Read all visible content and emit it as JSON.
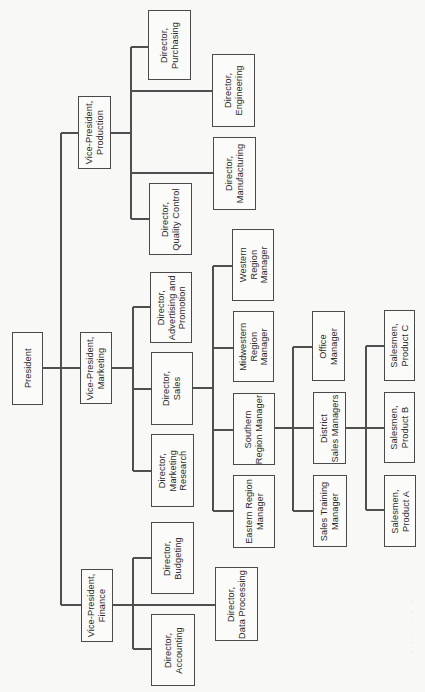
{
  "diagram": {
    "type": "organization-chart",
    "orientation": "rotated-90-ccw",
    "colors": {
      "line": "#4f4f4f",
      "box_border": "#4a4a4a",
      "background": "#f8f8f6",
      "text": "#2b2b2b"
    },
    "nodes": {
      "president": {
        "label": "President",
        "box": [
          12,
          332,
          31,
          73
        ]
      },
      "vp_production": {
        "label": "Vice-President,\nProduction",
        "box": [
          78,
          96,
          33,
          73
        ]
      },
      "vp_marketing": {
        "label": "Vice-President,\nMarketing",
        "box": [
          80,
          332,
          32,
          72
        ]
      },
      "vp_finance": {
        "label": "Vice-President,\nFinance",
        "box": [
          81,
          569,
          32,
          73
        ]
      },
      "dir_purchasing": {
        "label": "Director,\nPurchasing",
        "box": [
          148,
          10,
          43,
          70
        ]
      },
      "dir_engineering": {
        "label": "Director,\nEngineering",
        "box": [
          212,
          54,
          43,
          73
        ]
      },
      "dir_manufacturing": {
        "label": "Director,\nManufacturing",
        "box": [
          213,
          137,
          43,
          73
        ]
      },
      "dir_quality_control": {
        "label": "Director,\nQuality Control",
        "box": [
          149,
          183,
          43,
          72
        ]
      },
      "dir_adv_promotion": {
        "label": "Director,\nAdvertising and\nPromotion",
        "box": [
          150,
          272,
          42,
          71
        ]
      },
      "dir_sales": {
        "label": "Director,\nSales",
        "box": [
          151,
          352,
          42,
          73
        ]
      },
      "dir_marketing_research": {
        "label": "Director,\nMarketing\nResearch",
        "box": [
          151,
          434,
          43,
          73
        ]
      },
      "western_region": {
        "label": "Western\nRegion\nManager",
        "box": [
          232,
          229,
          42,
          72
        ]
      },
      "midwestern_region": {
        "label": "Midwestern\nRegion\nManager",
        "box": [
          233,
          311,
          41,
          71
        ]
      },
      "southern_region": {
        "label": "Southern\nRegion Manager",
        "box": [
          233,
          393,
          42,
          72
        ]
      },
      "eastern_region": {
        "label": "Eastern Region\nManager",
        "box": [
          233,
          475,
          42,
          73
        ]
      },
      "office_manager": {
        "label": "Office\nManager",
        "box": [
          312,
          311,
          33,
          70
        ]
      },
      "district_sales": {
        "label": "District\nSales Managers",
        "box": [
          313,
          392,
          33,
          72
        ]
      },
      "sales_training": {
        "label": "Sales Training\nManager",
        "box": [
          313,
          475,
          34,
          72
        ]
      },
      "salesmen_c": {
        "label": "Salesmen,\nProduct C",
        "box": [
          384,
          310,
          31,
          71
        ]
      },
      "salesmen_b": {
        "label": "Salesmen,\nProduct B",
        "box": [
          384,
          392,
          31,
          71
        ]
      },
      "salesmen_a": {
        "label": "Salesmen,\nProduct A",
        "box": [
          384,
          475,
          32,
          72
        ]
      },
      "dir_budgeting": {
        "label": "Director,\nBudgeting",
        "box": [
          151,
          522,
          43,
          72
        ]
      },
      "dir_data_processing": {
        "label": "Director,\nData Processing",
        "box": [
          215,
          567,
          43,
          74
        ]
      },
      "dir_accounting": {
        "label": "Director,\nAccounting",
        "box": [
          151,
          614,
          44,
          72
        ]
      }
    },
    "edges": [
      [
        "president",
        "vp_production"
      ],
      [
        "president",
        "vp_marketing"
      ],
      [
        "president",
        "vp_finance"
      ],
      [
        "vp_production",
        "dir_purchasing"
      ],
      [
        "vp_production",
        "dir_engineering"
      ],
      [
        "vp_production",
        "dir_manufacturing"
      ],
      [
        "vp_production",
        "dir_quality_control"
      ],
      [
        "vp_marketing",
        "dir_adv_promotion"
      ],
      [
        "vp_marketing",
        "dir_sales"
      ],
      [
        "vp_marketing",
        "dir_marketing_research"
      ],
      [
        "dir_sales",
        "western_region"
      ],
      [
        "dir_sales",
        "midwestern_region"
      ],
      [
        "dir_sales",
        "southern_region"
      ],
      [
        "dir_sales",
        "eastern_region"
      ],
      [
        "southern_region",
        "office_manager"
      ],
      [
        "southern_region",
        "district_sales"
      ],
      [
        "southern_region",
        "sales_training"
      ],
      [
        "district_sales",
        "salesmen_c"
      ],
      [
        "district_sales",
        "salesmen_b"
      ],
      [
        "district_sales",
        "salesmen_a"
      ],
      [
        "vp_finance",
        "dir_budgeting"
      ],
      [
        "vp_finance",
        "dir_data_processing"
      ],
      [
        "vp_finance",
        "dir_accounting"
      ]
    ],
    "caption": "· · · · · ·"
  }
}
